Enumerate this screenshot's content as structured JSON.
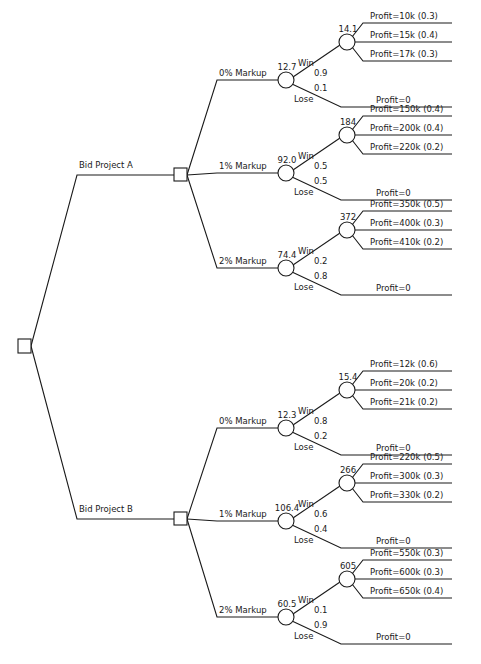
{
  "diagram": {
    "caption": "Figure 15.5",
    "colors": {
      "line": "#1a1a1a",
      "background": "#ffffff"
    },
    "root": {
      "type": "decision",
      "label": ""
    },
    "projects": [
      {
        "label": "Bid Project A",
        "markups": [
          {
            "label": "0% Markup",
            "ev": "12.7",
            "win": {
              "label": "Win",
              "prob": "0.9",
              "ev": "14.1",
              "outcomes": [
                "Profit=10k  (0.3)",
                "Profit=15k  (0.4)",
                "Profit=17k  (0.3)"
              ]
            },
            "lose": {
              "label": "Lose",
              "prob": "0.1",
              "outcome": "Profit=0"
            }
          },
          {
            "label": "1% Markup",
            "ev": "92.0",
            "win": {
              "label": "Win",
              "prob": "0.5",
              "ev": "184",
              "outcomes": [
                "Profit=150k  (0.4)",
                "Profit=200k  (0.4)",
                "Profit=220k  (0.2)"
              ]
            },
            "lose": {
              "label": "Lose",
              "prob": "0.5",
              "outcome": "Profit=0"
            }
          },
          {
            "label": "2% Markup",
            "ev": "74.4",
            "win": {
              "label": "Win",
              "prob": "0.2",
              "ev": "372",
              "outcomes": [
                "Profit=350k  (0.5)",
                "Profit=400k  (0.3)",
                "Profit=410k  (0.2)"
              ]
            },
            "lose": {
              "label": "Lose",
              "prob": "0.8",
              "outcome": "Profit=0"
            }
          }
        ]
      },
      {
        "label": "Bid Project B",
        "markups": [
          {
            "label": "0% Markup",
            "ev": "12.3",
            "win": {
              "label": "Win",
              "prob": "0.8",
              "ev": "15.4",
              "outcomes": [
                "Profit=12k  (0.6)",
                "Profit=20k  (0.2)",
                "Profit=21k  (0.2)"
              ]
            },
            "lose": {
              "label": "Lose",
              "prob": "0.2",
              "outcome": "Profit=0"
            }
          },
          {
            "label": "1% Markup",
            "ev": "106.4",
            "win": {
              "label": "Win",
              "prob": "0.6",
              "ev": "266",
              "outcomes": [
                "Profit=220k  (0.5)",
                "Profit=300k  (0.3)",
                "Profit=330k  (0.2)"
              ]
            },
            "lose": {
              "label": "Lose",
              "prob": "0.4",
              "outcome": "Profit=0"
            }
          },
          {
            "label": "2% Markup",
            "ev": "60.5",
            "win": {
              "label": "Win",
              "prob": "0.1",
              "ev": "605",
              "outcomes": [
                "Profit=550k  (0.3)",
                "Profit=600k  (0.3)",
                "Profit=650k  (0.4)"
              ]
            },
            "lose": {
              "label": "Lose",
              "prob": "0.9",
              "outcome": "Profit=0"
            }
          }
        ]
      }
    ]
  }
}
